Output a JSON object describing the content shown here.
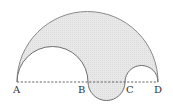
{
  "diagram": {
    "type": "geometry-figure",
    "points": [
      {
        "label": "A",
        "x": 17,
        "y": 82
      },
      {
        "label": "B",
        "x": 88,
        "y": 82
      },
      {
        "label": "C",
        "x": 125,
        "y": 82
      },
      {
        "label": "D",
        "x": 158,
        "y": 82
      }
    ],
    "labels": {
      "A": "A",
      "B": "B",
      "C": "C",
      "D": "D"
    },
    "arcs": [
      {
        "name": "semicircle-AD",
        "diameter": "AD",
        "side": "above"
      },
      {
        "name": "semicircle-AB",
        "diameter": "AB",
        "side": "above"
      },
      {
        "name": "semicircle-CD",
        "diameter": "CD",
        "side": "above"
      },
      {
        "name": "semicircle-BC",
        "diameter": "BC",
        "side": "below"
      }
    ],
    "baseline": {
      "from": "A",
      "to": "D",
      "style": "dashed"
    },
    "colors": {
      "fill": "#e6e6e6",
      "stroke": "#808080",
      "dashed_line": "#555555",
      "label": "#333333"
    }
  }
}
